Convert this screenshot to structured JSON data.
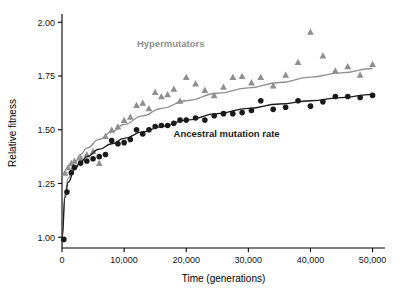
{
  "chart_data": {
    "type": "scatter",
    "title": "",
    "xlabel": "Time (generations)",
    "ylabel": "Relative fitness",
    "xlim": [
      0,
      52000
    ],
    "ylim": [
      0.95,
      2.02
    ],
    "xticks": [
      0,
      10000,
      20000,
      30000,
      40000,
      50000
    ],
    "xtick_labels": [
      "0",
      "10,000",
      "20,000",
      "30,000",
      "40,000",
      "50,000"
    ],
    "yticks": [
      1.0,
      1.25,
      1.5,
      1.75,
      2.0
    ],
    "ytick_labels": [
      "1.00",
      "1.25",
      "1.50",
      "1.75",
      "2.00"
    ],
    "grid": false,
    "legend_position": "inline-annotations",
    "series": [
      {
        "name": "Hypermutators",
        "label": "Hypermutators",
        "color": "#8f8f8f",
        "marker": "triangle",
        "label_x": 17500,
        "label_y": 1.885,
        "points": [
          {
            "x": 500,
            "y": 1.3
          },
          {
            "x": 1000,
            "y": 1.325
          },
          {
            "x": 1500,
            "y": 1.345
          },
          {
            "x": 2000,
            "y": 1.355
          },
          {
            "x": 3000,
            "y": 1.37
          },
          {
            "x": 4000,
            "y": 1.385
          },
          {
            "x": 5000,
            "y": 1.4
          },
          {
            "x": 6000,
            "y": 1.345
          },
          {
            "x": 7000,
            "y": 1.47
          },
          {
            "x": 8000,
            "y": 1.5
          },
          {
            "x": 9000,
            "y": 1.515
          },
          {
            "x": 10000,
            "y": 1.545
          },
          {
            "x": 11000,
            "y": 1.56
          },
          {
            "x": 12000,
            "y": 1.615
          },
          {
            "x": 13000,
            "y": 1.625
          },
          {
            "x": 14000,
            "y": 1.6
          },
          {
            "x": 15000,
            "y": 1.675
          },
          {
            "x": 16000,
            "y": 1.655
          },
          {
            "x": 17000,
            "y": 1.665
          },
          {
            "x": 18000,
            "y": 1.69
          },
          {
            "x": 19000,
            "y": 1.635
          },
          {
            "x": 20000,
            "y": 1.745
          },
          {
            "x": 21500,
            "y": 1.715
          },
          {
            "x": 23000,
            "y": 1.685
          },
          {
            "x": 24500,
            "y": 1.66
          },
          {
            "x": 26000,
            "y": 1.7
          },
          {
            "x": 27500,
            "y": 1.745
          },
          {
            "x": 29000,
            "y": 1.75
          },
          {
            "x": 30500,
            "y": 1.72
          },
          {
            "x": 32000,
            "y": 1.745
          },
          {
            "x": 34000,
            "y": 1.705
          },
          {
            "x": 36000,
            "y": 1.755
          },
          {
            "x": 38000,
            "y": 1.815
          },
          {
            "x": 40000,
            "y": 1.955
          },
          {
            "x": 42000,
            "y": 1.845
          },
          {
            "x": 44000,
            "y": 1.775
          },
          {
            "x": 46000,
            "y": 1.795
          },
          {
            "x": 48000,
            "y": 1.755
          },
          {
            "x": 50000,
            "y": 1.805
          }
        ],
        "fit_curve": [
          {
            "x": 0,
            "y": 1.0
          },
          {
            "x": 500,
            "y": 1.205
          },
          {
            "x": 1000,
            "y": 1.275
          },
          {
            "x": 2000,
            "y": 1.345
          },
          {
            "x": 3000,
            "y": 1.385
          },
          {
            "x": 4000,
            "y": 1.415
          },
          {
            "x": 6000,
            "y": 1.455
          },
          {
            "x": 8000,
            "y": 1.49
          },
          {
            "x": 10000,
            "y": 1.525
          },
          {
            "x": 13000,
            "y": 1.565
          },
          {
            "x": 16000,
            "y": 1.6
          },
          {
            "x": 20000,
            "y": 1.635
          },
          {
            "x": 25000,
            "y": 1.67
          },
          {
            "x": 30000,
            "y": 1.695
          },
          {
            "x": 35000,
            "y": 1.72
          },
          {
            "x": 40000,
            "y": 1.745
          },
          {
            "x": 45000,
            "y": 1.765
          },
          {
            "x": 50000,
            "y": 1.785
          }
        ]
      },
      {
        "name": "Ancestral mutation rate",
        "label": "Ancestral mutation rate",
        "color": "#1a1a1a",
        "marker": "circle",
        "label_x": 26500,
        "label_y": 1.465,
        "points": [
          {
            "x": 300,
            "y": 0.99
          },
          {
            "x": 800,
            "y": 1.21
          },
          {
            "x": 1500,
            "y": 1.3
          },
          {
            "x": 2000,
            "y": 1.325
          },
          {
            "x": 3000,
            "y": 1.345
          },
          {
            "x": 4000,
            "y": 1.355
          },
          {
            "x": 5000,
            "y": 1.365
          },
          {
            "x": 6000,
            "y": 1.375
          },
          {
            "x": 7000,
            "y": 1.385
          },
          {
            "x": 8000,
            "y": 1.45
          },
          {
            "x": 9000,
            "y": 1.435
          },
          {
            "x": 10000,
            "y": 1.44
          },
          {
            "x": 11000,
            "y": 1.455
          },
          {
            "x": 12000,
            "y": 1.5
          },
          {
            "x": 13000,
            "y": 1.48
          },
          {
            "x": 14000,
            "y": 1.5
          },
          {
            "x": 15000,
            "y": 1.515
          },
          {
            "x": 16000,
            "y": 1.52
          },
          {
            "x": 17000,
            "y": 1.52
          },
          {
            "x": 18000,
            "y": 1.53
          },
          {
            "x": 19000,
            "y": 1.545
          },
          {
            "x": 20000,
            "y": 1.545
          },
          {
            "x": 21500,
            "y": 1.555
          },
          {
            "x": 23000,
            "y": 1.545
          },
          {
            "x": 24500,
            "y": 1.565
          },
          {
            "x": 26000,
            "y": 1.575
          },
          {
            "x": 27500,
            "y": 1.575
          },
          {
            "x": 29000,
            "y": 1.58
          },
          {
            "x": 30500,
            "y": 1.59
          },
          {
            "x": 32000,
            "y": 1.635
          },
          {
            "x": 34000,
            "y": 1.595
          },
          {
            "x": 36000,
            "y": 1.605
          },
          {
            "x": 38000,
            "y": 1.635
          },
          {
            "x": 40000,
            "y": 1.61
          },
          {
            "x": 42000,
            "y": 1.63
          },
          {
            "x": 44000,
            "y": 1.655
          },
          {
            "x": 46000,
            "y": 1.655
          },
          {
            "x": 48000,
            "y": 1.65
          },
          {
            "x": 50000,
            "y": 1.66
          }
        ],
        "fit_curve": [
          {
            "x": 0,
            "y": 0.995
          },
          {
            "x": 500,
            "y": 1.185
          },
          {
            "x": 1000,
            "y": 1.255
          },
          {
            "x": 2000,
            "y": 1.315
          },
          {
            "x": 3000,
            "y": 1.35
          },
          {
            "x": 4000,
            "y": 1.375
          },
          {
            "x": 6000,
            "y": 1.41
          },
          {
            "x": 8000,
            "y": 1.435
          },
          {
            "x": 10000,
            "y": 1.46
          },
          {
            "x": 13000,
            "y": 1.49
          },
          {
            "x": 16000,
            "y": 1.515
          },
          {
            "x": 20000,
            "y": 1.545
          },
          {
            "x": 25000,
            "y": 1.575
          },
          {
            "x": 30000,
            "y": 1.6
          },
          {
            "x": 35000,
            "y": 1.62
          },
          {
            "x": 40000,
            "y": 1.635
          },
          {
            "x": 45000,
            "y": 1.65
          },
          {
            "x": 50000,
            "y": 1.665
          }
        ]
      }
    ]
  }
}
